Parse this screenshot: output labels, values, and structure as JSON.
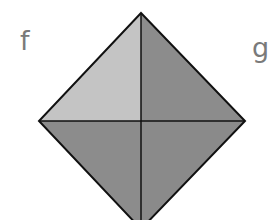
{
  "diagram": {
    "labels": {
      "f": "f",
      "g": "g"
    },
    "shape": "square rotated 45° divided into four quadrants",
    "regions": [
      {
        "name": "top-left",
        "color": "#c4c4c4"
      },
      {
        "name": "top-right",
        "color": "#8c8c8c"
      },
      {
        "name": "bottom-left",
        "color": "#8c8c8c"
      },
      {
        "name": "bottom-right",
        "color": "#8c8c8c"
      }
    ],
    "stroke_color": "#111111"
  }
}
